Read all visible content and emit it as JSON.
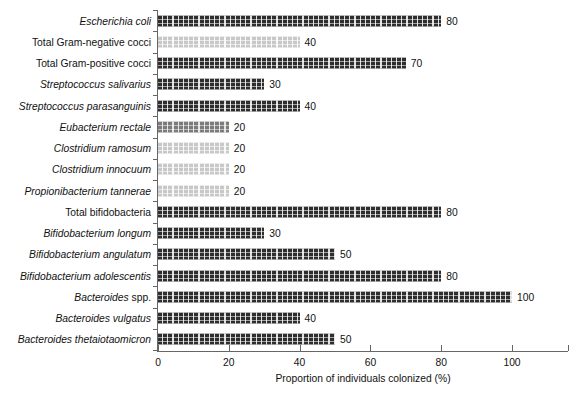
{
  "chart_data": {
    "type": "bar",
    "orientation": "horizontal",
    "title": "",
    "xlabel": "Proportion of individuals colonized (%)",
    "ylabel": "",
    "xlim": [
      0,
      115.8
    ],
    "xticks": [
      0,
      20,
      40,
      60,
      80,
      100
    ],
    "xtick_labels": [
      "0",
      "20",
      "40",
      "60",
      "80",
      "100"
    ],
    "grid": false,
    "legend": "none",
    "categories": [
      "Escherichia coli",
      "Total Gram-negative cocci",
      "Total Gram-positive cocci",
      "Streptococcus salivarius",
      "Streptococcus parasanguinis",
      "Eubacterium rectale",
      "Clostridium ramosum",
      "Clostridium innocuum",
      "Propionibacterium tannerae",
      "Total bifidobacteria",
      "Bifidobacterium longum",
      "Bifidobacterium angulatum",
      "Bifidobacterium adolescentis",
      "Bacteroides spp.",
      "Bacteroides vulgatus",
      "Bacteroides thetaiotaomicron"
    ],
    "values": [
      80,
      40,
      70,
      30,
      40,
      20,
      20,
      20,
      20,
      80,
      30,
      50,
      80,
      100,
      40,
      50
    ],
    "value_labels": [
      "80",
      "40",
      "70",
      "30",
      "40",
      "20",
      "20",
      "20",
      "20",
      "80",
      "30",
      "50",
      "80",
      "100",
      "40",
      "50"
    ],
    "bar_shades": [
      "medium",
      "light",
      "dark",
      "dark",
      "dark",
      "medium",
      "light",
      "light",
      "light",
      "dark",
      "dark",
      "dark",
      "dark",
      "dark",
      "dark",
      "dark"
    ],
    "label_styles": [
      "italic",
      "roman",
      "roman",
      "italic",
      "italic",
      "italic",
      "italic",
      "italic",
      "italic",
      "roman",
      "italic",
      "italic",
      "italic",
      "italic-genus",
      "italic",
      "italic"
    ],
    "colors": {
      "dark": "#2e2e2e",
      "medium": "#7b7b7b",
      "light": "#c8c8c8",
      "axis": "#666666",
      "text": "#111111",
      "background": "#ffffff"
    }
  },
  "rows": [
    {
      "label": "Escherichia coli",
      "label_roman_suffix": "",
      "value": 80,
      "value_label": "80",
      "shade": "dark"
    },
    {
      "label": "Total Gram-negative cocci",
      "label_roman_suffix": "",
      "value": 40,
      "value_label": "40",
      "shade": "light"
    },
    {
      "label": "Total Gram-positive cocci",
      "label_roman_suffix": "",
      "value": 70,
      "value_label": "70",
      "shade": "dark"
    },
    {
      "label": "Streptococcus salivarius",
      "label_roman_suffix": "",
      "value": 30,
      "value_label": "30",
      "shade": "dark"
    },
    {
      "label": "Streptococcus parasanguinis",
      "label_roman_suffix": "",
      "value": 40,
      "value_label": "40",
      "shade": "dark"
    },
    {
      "label": "Eubacterium rectale",
      "label_roman_suffix": "",
      "value": 20,
      "value_label": "20",
      "shade": "medium"
    },
    {
      "label": "Clostridium ramosum",
      "label_roman_suffix": "",
      "value": 20,
      "value_label": "20",
      "shade": "light"
    },
    {
      "label": "Clostridium innocuum",
      "label_roman_suffix": "",
      "value": 20,
      "value_label": "20",
      "shade": "light"
    },
    {
      "label": "Propionibacterium tannerae",
      "label_roman_suffix": "",
      "value": 20,
      "value_label": "20",
      "shade": "light"
    },
    {
      "label": "Total bifidobacteria",
      "label_roman_suffix": "",
      "value": 80,
      "value_label": "80",
      "shade": "dark"
    },
    {
      "label": "Bifidobacterium longum",
      "label_roman_suffix": "",
      "value": 30,
      "value_label": "30",
      "shade": "dark"
    },
    {
      "label": "Bifidobacterium angulatum",
      "label_roman_suffix": "",
      "value": 50,
      "value_label": "50",
      "shade": "dark"
    },
    {
      "label": "Bifidobacterium adolescentis",
      "label_roman_suffix": "",
      "value": 80,
      "value_label": "80",
      "shade": "dark"
    },
    {
      "label": "Bacteroides",
      "label_roman_suffix": " spp.",
      "value": 100,
      "value_label": "100",
      "shade": "dark"
    },
    {
      "label": "Bacteroides vulgatus",
      "label_roman_suffix": "",
      "value": 40,
      "value_label": "40",
      "shade": "dark"
    },
    {
      "label": "Bacteroides thetaiotaomicron",
      "label_roman_suffix": "",
      "value": 50,
      "value_label": "50",
      "shade": "dark"
    }
  ],
  "axis": {
    "x_title": "Proportion of individuals colonized (%)",
    "x_tick_labels": [
      "0",
      "20",
      "40",
      "60",
      "80",
      "100"
    ]
  }
}
